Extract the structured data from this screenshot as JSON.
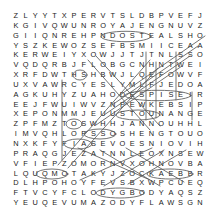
{
  "document": {
    "type": "word-search-puzzle",
    "title": "Word Search Puzzle",
    "grid_size": {
      "rows": 20,
      "cols": 20
    },
    "ink_color": "#1a1a1a",
    "mark_color": "#555555",
    "background_color": "#ffffff"
  },
  "grid": {
    "rows": [
      [
        "Z",
        "L",
        "Y",
        "Y",
        "T",
        "X",
        "P",
        "E",
        "R",
        "V",
        "T",
        "S",
        "L",
        "D",
        "B",
        "P",
        "V",
        "E",
        "F",
        "J"
      ],
      [
        "K",
        "G",
        "I",
        "V",
        "Q",
        "W",
        "U",
        "N",
        "R",
        "O",
        "Y",
        "A",
        "J",
        "E",
        "N",
        "G",
        "N",
        "U",
        "V",
        "Z"
      ],
      [
        "G",
        "I",
        "I",
        "Q",
        "N",
        "R",
        "E",
        "H",
        "P",
        "N",
        "D",
        "O",
        "S",
        "T",
        "E",
        "A",
        "L",
        "S",
        "H",
        "O"
      ],
      [
        "Y",
        "S",
        "Z",
        "K",
        "E",
        "W",
        "O",
        "Z",
        "S",
        "E",
        "F",
        "B",
        "S",
        "M",
        "I",
        "I",
        "C",
        "E",
        "A",
        "A"
      ],
      [
        "K",
        "E",
        "R",
        "W",
        "E",
        "I",
        "Y",
        "X",
        "O",
        "W",
        "J",
        "J",
        "T",
        "J",
        "T",
        "N",
        "L",
        "S",
        "S",
        "O"
      ],
      [
        "V",
        "Q",
        "D",
        "Q",
        "R",
        "B",
        "J",
        "F",
        "L",
        "O",
        "B",
        "G",
        "C",
        "N",
        "H",
        "N",
        "T",
        "W",
        "E",
        "I"
      ],
      [
        "X",
        "R",
        "F",
        "D",
        "W",
        "T",
        "H",
        "S",
        "H",
        "B",
        "W",
        "J",
        "L",
        "Q",
        "E",
        "F",
        "O",
        "W",
        "V",
        "F"
      ],
      [
        "U",
        "X",
        "V",
        "A",
        "W",
        "R",
        "C",
        "Y",
        "E",
        "S",
        "L",
        "Y",
        "M",
        "L",
        "F",
        "J",
        "E",
        "D",
        "O",
        "A"
      ],
      [
        "A",
        "G",
        "K",
        "U",
        "H",
        "Y",
        "Z",
        "U",
        "A",
        "H",
        "O",
        "D",
        "E",
        "S",
        "P",
        "I",
        "S",
        "E",
        "I",
        "R"
      ],
      [
        "E",
        "E",
        "J",
        "F",
        "W",
        "U",
        "I",
        "W",
        "V",
        "Z",
        "N",
        "P",
        "E",
        "W",
        "K",
        "E",
        "B",
        "S",
        "I",
        "P"
      ],
      [
        "X",
        "E",
        "P",
        "O",
        "N",
        "M",
        "M",
        "J",
        "E",
        "U",
        "U",
        "S",
        "T",
        "O",
        "U",
        "N",
        "A",
        "N",
        "G",
        "E"
      ],
      [
        "Z",
        "P",
        "F",
        "M",
        "Z",
        "T",
        "O",
        "S",
        "W",
        "H",
        "H",
        "J",
        "A",
        "N",
        "N",
        "O",
        "U",
        "H",
        "H",
        "L"
      ],
      [
        "I",
        "M",
        "V",
        "Q",
        "H",
        "L",
        "O",
        "P",
        "S",
        "S",
        "O",
        "S",
        "H",
        "E",
        "N",
        "G",
        "T",
        "O",
        "U",
        "O"
      ],
      [
        "N",
        "X",
        "K",
        "F",
        "Y",
        "F",
        "I",
        "A",
        "S",
        "E",
        "V",
        "O",
        "E",
        "S",
        "N",
        "I",
        "O",
        "V",
        "I",
        "H"
      ],
      [
        "P",
        "R",
        "A",
        "Q",
        "G",
        "J",
        "E",
        "Z",
        "A",
        "T",
        "N",
        "N",
        "L",
        "E",
        "O",
        "X",
        "N",
        "S",
        "E",
        "W"
      ],
      [
        "V",
        "F",
        "I",
        "E",
        "P",
        "Z",
        "O",
        "M",
        "O",
        "R",
        "N",
        "V",
        "X",
        "O",
        "H",
        "N",
        "O",
        "V",
        "B",
        "A"
      ],
      [
        "L",
        "Q",
        "U",
        "Q",
        "M",
        "O",
        "T",
        "A",
        "K",
        "Y",
        "J",
        "Z",
        "O",
        "C",
        "K",
        "A",
        "E",
        "B",
        "B",
        "R"
      ],
      [
        "D",
        "L",
        "H",
        "P",
        "O",
        "H",
        "O",
        "Y",
        "F",
        "E",
        "V",
        "S",
        "B",
        "X",
        "W",
        "P",
        "C",
        "U",
        "E",
        "Q"
      ],
      [
        "F",
        "T",
        "V",
        "C",
        "Y",
        "F",
        "C",
        "L",
        "O",
        "D",
        "Y",
        "G",
        "B",
        "O",
        "D",
        "Y",
        "A",
        "Q",
        "S",
        "Z"
      ],
      [
        "Y",
        "E",
        "U",
        "Q",
        "E",
        "V",
        "U",
        "M",
        "A",
        "Z",
        "O",
        "D",
        "Y",
        "F",
        "L",
        "A",
        "W",
        "S",
        "G",
        "N"
      ]
    ]
  },
  "marks": {
    "description": "Hand-drawn circles and diagonal strike-through lines marking found words",
    "found_word_highlights": [
      {
        "word": "STEAL",
        "row": 3,
        "start_col": 13,
        "end_col": 17,
        "shape": "oval"
      },
      {
        "word": "DESPISE",
        "row": 9,
        "start_col": 12,
        "end_col": 18,
        "shape": "oval"
      }
    ]
  }
}
